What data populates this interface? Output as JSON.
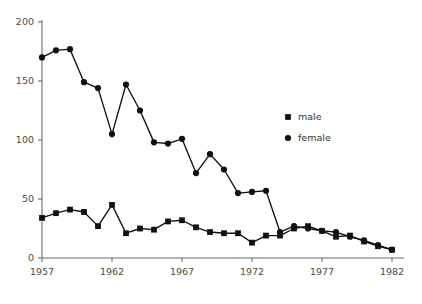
{
  "chart_data": {
    "type": "line",
    "title": "",
    "subtitle": "",
    "xlabel": "",
    "ylabel": "",
    "x": [
      1957,
      1958,
      1959,
      1960,
      1961,
      1962,
      1963,
      1964,
      1965,
      1966,
      1967,
      1968,
      1969,
      1970,
      1971,
      1972,
      1973,
      1974,
      1975,
      1976,
      1977,
      1978,
      1979,
      1980,
      1981,
      1982
    ],
    "xlim": [
      1957,
      1982
    ],
    "ylim": [
      0,
      200
    ],
    "xticks": [
      1957,
      1962,
      1967,
      1972,
      1977,
      1982
    ],
    "xtick_labels": [
      "1957",
      "1962",
      "1967",
      "1972",
      "1977",
      "1982"
    ],
    "yticks": [
      0,
      50,
      100,
      150,
      200
    ],
    "ytick_labels": [
      "0",
      "50",
      "100",
      "150",
      "200"
    ],
    "grid": false,
    "legend_position": "upper-right",
    "series": [
      {
        "name": "male",
        "marker": "square",
        "color": "#111111",
        "values": [
          34,
          38,
          41,
          39,
          27,
          45,
          21,
          25,
          24,
          31,
          32,
          26,
          22,
          21,
          21,
          13,
          19,
          19,
          25,
          27,
          23,
          18,
          19,
          14,
          10,
          7
        ]
      },
      {
        "name": "female",
        "marker": "circle",
        "color": "#111111",
        "values": [
          170,
          176,
          177,
          149,
          144,
          105,
          147,
          125,
          98,
          97,
          101,
          72,
          88,
          75,
          55,
          56,
          57,
          22,
          27,
          25,
          23,
          22,
          18,
          15,
          11,
          7
        ]
      }
    ]
  },
  "legend": {
    "entries": [
      {
        "label": "male",
        "marker": "square"
      },
      {
        "label": "female",
        "marker": "circle"
      }
    ]
  }
}
